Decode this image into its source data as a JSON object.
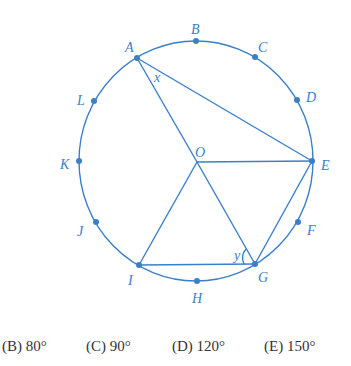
{
  "diagram": {
    "stroke_color": "#3a7fc8",
    "center": {
      "label": "O",
      "x": 197,
      "y": 162
    },
    "points": [
      {
        "label": "A",
        "x": 137,
        "y": 58,
        "lx": 125,
        "ly": 52
      },
      {
        "label": "B",
        "x": 196,
        "y": 41,
        "lx": 191,
        "ly": 34
      },
      {
        "label": "C",
        "x": 255,
        "y": 57,
        "lx": 258,
        "ly": 52
      },
      {
        "label": "D",
        "x": 297,
        "y": 100,
        "lx": 306,
        "ly": 102
      },
      {
        "label": "E",
        "x": 312,
        "y": 161,
        "lx": 321,
        "ly": 170
      },
      {
        "label": "F",
        "x": 298,
        "y": 222,
        "lx": 307,
        "ly": 235
      },
      {
        "label": "G",
        "x": 255,
        "y": 264,
        "lx": 258,
        "ly": 282
      },
      {
        "label": "H",
        "x": 197,
        "y": 281,
        "lx": 192,
        "ly": 303
      },
      {
        "label": "I",
        "x": 139,
        "y": 265,
        "lx": 128,
        "ly": 285
      },
      {
        "label": "J",
        "x": 96,
        "y": 222,
        "lx": 77,
        "ly": 236
      },
      {
        "label": "K",
        "x": 79,
        "y": 161,
        "lx": 60,
        "ly": 169
      },
      {
        "label": "L",
        "x": 94,
        "y": 101,
        "lx": 77,
        "ly": 105
      }
    ],
    "angle_labels": [
      {
        "label": "x",
        "x": 154,
        "y": 82
      },
      {
        "label": "y",
        "x": 234,
        "y": 260
      }
    ]
  },
  "choices": [
    {
      "label": "(B) 80°",
      "x": 2
    },
    {
      "label": "(C) 90°",
      "x": 86
    },
    {
      "label": "(D) 120°",
      "x": 172
    },
    {
      "label": "(E) 150°",
      "x": 264
    }
  ]
}
